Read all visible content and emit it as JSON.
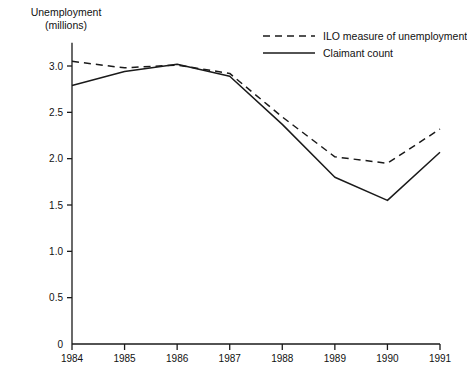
{
  "chart_data": {
    "type": "line",
    "title": "",
    "ylabel": "Unemployment (millions)",
    "ylabel_line1": "Unemployment",
    "ylabel_line2": "(millions)",
    "xlabel": "",
    "categories": [
      "1984",
      "1985",
      "1986",
      "1987",
      "1988",
      "1989",
      "1990",
      "1991"
    ],
    "x": [
      1984,
      1985,
      1986,
      1987,
      1988,
      1989,
      1990,
      1991
    ],
    "ylim": [
      0,
      3.25
    ],
    "xlim": [
      1983.6,
      1991.4
    ],
    "grid": false,
    "legend_position": "top-right",
    "ytick_labels": [
      "0",
      "0.5",
      "1.0",
      "1.5",
      "2.0",
      "2.5",
      "3.0"
    ],
    "yticks": [
      0,
      0.5,
      1.0,
      1.5,
      2.0,
      2.5,
      3.0
    ],
    "series": [
      {
        "name": "ILO measure of unemployment",
        "style": "dashed",
        "color": "#1a1a1a",
        "values": [
          3.05,
          2.98,
          3.01,
          2.92,
          2.45,
          2.02,
          1.95,
          2.32
        ]
      },
      {
        "name": "Claimant count",
        "style": "solid",
        "color": "#1a1a1a",
        "values": [
          2.79,
          2.94,
          3.02,
          2.89,
          2.37,
          1.8,
          1.55,
          2.07
        ]
      }
    ]
  },
  "legend": {
    "items": [
      {
        "label": "ILO measure of unemployment",
        "style": "dashed"
      },
      {
        "label": "Claimant count",
        "style": "solid"
      }
    ]
  }
}
